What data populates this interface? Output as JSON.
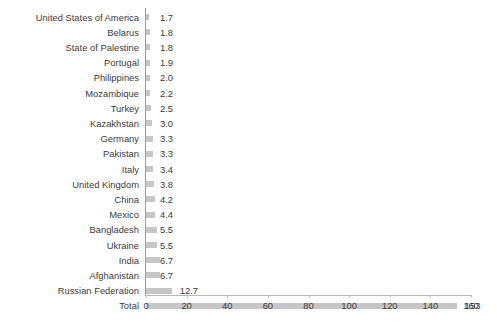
{
  "chart_data": {
    "type": "bar",
    "orientation": "horizontal",
    "title": "",
    "subtitle": "",
    "xlabel": "",
    "ylabel": "",
    "xlim": [
      0,
      160
    ],
    "xticks": [
      0,
      20,
      40,
      60,
      80,
      100,
      120,
      140,
      160
    ],
    "xtick_labels": [
      "0",
      "20",
      "40",
      "60",
      "80",
      "100",
      "120",
      "140",
      "160"
    ],
    "grid": false,
    "legend": null,
    "categories": [
      "United States of America",
      "Belarus",
      "State of Palestine",
      "Portugal",
      "Philippines",
      "Mozambique",
      "Turkey",
      "Kazakhstan",
      "Germany",
      "Pakistan",
      "Italy",
      "United Kingdom",
      "China",
      "Mexico",
      "Bangladesh",
      "Ukraine",
      "India",
      "Afghanistan",
      "Russian Federation",
      "Total"
    ],
    "values": [
      1.7,
      1.8,
      1.8,
      1.9,
      2.0,
      2.2,
      2.5,
      3.0,
      3.3,
      3.3,
      3.4,
      3.8,
      4.2,
      4.4,
      5.5,
      5.5,
      6.7,
      6.7,
      12.7,
      153
    ],
    "data_labels": [
      "1.7",
      "1.8",
      "1.8",
      "1.9",
      "2.0",
      "2.2",
      "2.5",
      "3.0",
      "3.3",
      "3.3",
      "3.4",
      "3.8",
      "4.2",
      "4.4",
      "5.5",
      "5.5",
      "6.7",
      "6.7",
      "12.7",
      "153"
    ],
    "bar_color": "#c6c6c6",
    "text_color": "#3d3d3d",
    "axis_color": "#9a9a9a"
  }
}
